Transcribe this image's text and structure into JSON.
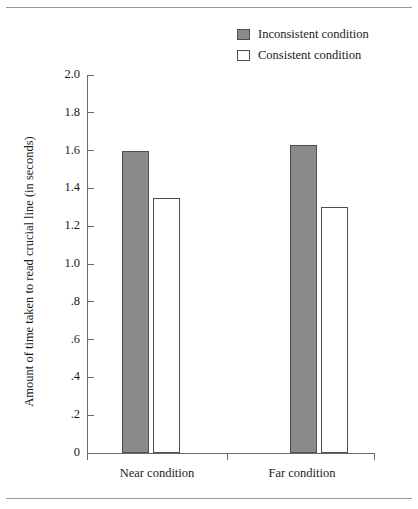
{
  "chart_data": {
    "type": "bar",
    "title": "",
    "xlabel": "",
    "ylabel": "Amount of time taken to read crucial line (in seconds)",
    "categories": [
      "Near condition",
      "Far condition"
    ],
    "series": [
      {
        "name": "Inconsistent condition",
        "values": [
          1.6,
          1.63
        ],
        "color": "#8a8a8a"
      },
      {
        "name": "Consistent condition",
        "values": [
          1.35,
          1.3
        ],
        "color": "#ffffff"
      }
    ],
    "ylim": [
      0,
      2.0
    ],
    "ytick_values": [
      0,
      0.2,
      0.4,
      0.6,
      0.8,
      1.0,
      1.2,
      1.4,
      1.6,
      1.8,
      2.0
    ],
    "ytick_labels": [
      "0",
      ".2",
      ".4",
      ".6",
      ".8",
      "1.0",
      "1.2",
      "1.4",
      "1.6",
      "1.8",
      "2.0"
    ],
    "grid": false,
    "legend_position": "top-right"
  },
  "legend": {
    "items": [
      {
        "label": "Inconsistent condition",
        "swatch": "filled-square-icon"
      },
      {
        "label": "Consistent condition",
        "swatch": "empty-square-icon"
      }
    ]
  },
  "axes": {
    "y_title": "Amount of time taken to read crucial line (in seconds)",
    "y_labels": [
      "2.0",
      "1.8",
      "1.6",
      "1.4",
      "1.2",
      "1.0",
      ".8",
      ".6",
      ".4",
      ".2",
      "0"
    ],
    "x_labels": [
      "Near condition",
      "Far condition"
    ]
  }
}
